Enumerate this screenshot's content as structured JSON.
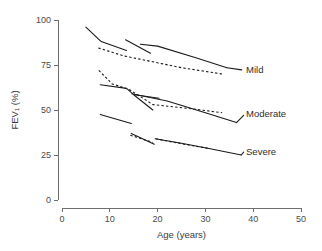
{
  "chart_data": {
    "type": "line",
    "title": "",
    "xlabel": "Age (years)",
    "ylabel": "FEV₁ (%)",
    "xlim": [
      0,
      50
    ],
    "ylim": [
      0,
      100
    ],
    "xticks": [
      0,
      10,
      20,
      30,
      40,
      50
    ],
    "yticks": [
      0,
      25,
      50,
      75,
      100
    ],
    "xtick_labels": [
      "0",
      "10",
      "20",
      "30",
      "40",
      "50"
    ],
    "ytick_labels": [
      "0",
      "25",
      "50",
      "75",
      "100"
    ],
    "grid": false,
    "legend_position": "inline-right-labels",
    "annotations": [
      {
        "text": "Mild",
        "x": 38.5,
        "y": 72.5
      },
      {
        "text": "Moderate",
        "x": 38.5,
        "y": 48.0
      },
      {
        "text": "Severe",
        "x": 38.5,
        "y": 27.0
      }
    ],
    "series": [
      {
        "name": "Mild - cohort 1 (solid)",
        "group": "Mild",
        "style": "solid",
        "points": [
          [
            5.0,
            96.0
          ],
          [
            8.2,
            88.0
          ],
          [
            13.5,
            83.0
          ]
        ]
      },
      {
        "name": "Mild - cohort 2 (solid)",
        "group": "Mild",
        "style": "solid",
        "points": [
          [
            13.3,
            89.0
          ],
          [
            18.5,
            81.5
          ]
        ]
      },
      {
        "name": "Mild - cohort 3 (solid)",
        "group": "Mild",
        "style": "solid",
        "points": [
          [
            16.4,
            86.5
          ],
          [
            20.0,
            85.5
          ],
          [
            28.0,
            79.0
          ],
          [
            34.5,
            73.5
          ]
        ]
      },
      {
        "name": "Mild - overall trend (dashed)",
        "group": "Mild",
        "style": "dashed",
        "points": [
          [
            7.6,
            84.5
          ],
          [
            13.0,
            80.0
          ],
          [
            18.6,
            77.0
          ],
          [
            25.0,
            73.5
          ],
          [
            33.5,
            70.0
          ]
        ]
      },
      {
        "name": "Moderate - cohort 1 (solid)",
        "group": "Moderate",
        "style": "solid",
        "points": [
          [
            8.0,
            64.0
          ],
          [
            13.5,
            62.0
          ],
          [
            15.0,
            58.5
          ],
          [
            19.0,
            50.0
          ]
        ]
      },
      {
        "name": "Moderate - cohort 2 (solid)",
        "group": "Moderate",
        "style": "solid",
        "points": [
          [
            15.2,
            58.5
          ],
          [
            20.3,
            56.5
          ]
        ]
      },
      {
        "name": "Moderate - cohort 3 (solid)",
        "group": "Moderate",
        "style": "solid",
        "points": [
          [
            14.6,
            59.0
          ],
          [
            22.0,
            55.0
          ],
          [
            30.0,
            48.5
          ],
          [
            36.5,
            43.0
          ]
        ]
      },
      {
        "name": "Moderate - overall trend (dashed)",
        "group": "Moderate",
        "style": "dashed",
        "points": [
          [
            7.7,
            72.0
          ],
          [
            10.5,
            64.5
          ],
          [
            14.0,
            61.5
          ],
          [
            19.0,
            53.0
          ],
          [
            26.0,
            51.0
          ],
          [
            33.5,
            48.5
          ]
        ]
      },
      {
        "name": "Severe - cohort 1 (solid)",
        "group": "Severe",
        "style": "solid",
        "points": [
          [
            8.0,
            47.5
          ],
          [
            14.5,
            42.5
          ]
        ]
      },
      {
        "name": "Severe - cohort 2 (solid)",
        "group": "Severe",
        "style": "solid",
        "points": [
          [
            14.5,
            37.0
          ],
          [
            19.3,
            31.0
          ]
        ]
      },
      {
        "name": "Severe - cohort 3 (solid)",
        "group": "Severe",
        "style": "solid",
        "points": [
          [
            19.5,
            34.0
          ],
          [
            25.0,
            31.5
          ],
          [
            31.0,
            28.5
          ],
          [
            37.5,
            25.0
          ]
        ]
      },
      {
        "name": "Severe - overall trend (dashed)",
        "group": "Severe",
        "style": "dashed",
        "points": [
          [
            14.3,
            36.0
          ],
          [
            19.0,
            32.0
          ]
        ]
      },
      {
        "name": "Severe - overall trend 2 (dashed)",
        "group": "Severe",
        "style": "dashed",
        "points": [
          [
            19.6,
            34.0
          ],
          [
            25.5,
            31.0
          ],
          [
            31.0,
            28.5
          ]
        ]
      }
    ],
    "leaders": [
      {
        "name": "mild-leader",
        "points": [
          [
            34.5,
            73.5
          ],
          [
            37.6,
            72.3
          ]
        ]
      },
      {
        "name": "moderate-leader",
        "points": [
          [
            36.5,
            43.0
          ],
          [
            38.0,
            47.0
          ]
        ]
      },
      {
        "name": "severe-leader",
        "points": [
          [
            37.5,
            25.0
          ],
          [
            38.0,
            26.6
          ]
        ]
      }
    ]
  },
  "colors": {
    "axis": "#6e6e6e",
    "ink": "#1a1a1a",
    "text": "#3b3b3b",
    "background": "#ffffff"
  }
}
